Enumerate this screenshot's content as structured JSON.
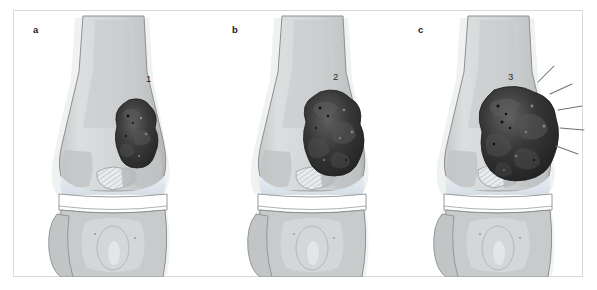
{
  "figure": {
    "type": "medical-illustration",
    "background_color": "#ffffff",
    "frame_color": "#d8d9da"
  },
  "panels": [
    {
      "id": "a",
      "letter": "a",
      "lesion_label": "1",
      "lesion_stage": "small intramedullary lesion",
      "has_burst_lines": false
    },
    {
      "id": "b",
      "letter": "b",
      "lesion_label": "2",
      "lesion_stage": "enlarged lesion expanding toward cortex",
      "has_burst_lines": true
    },
    {
      "id": "c",
      "letter": "c",
      "lesion_label": "3",
      "lesion_stage": "lesion breaking through cortex",
      "has_burst_lines": true
    }
  ],
  "colors": {
    "bone_cortex": "#b9bcbd",
    "bone_medulla": "#cdd0d1",
    "bone_light": "#dadddd",
    "cartilage": "#dfe6ee",
    "joint_space": "#ffffff",
    "soft_tissue": "#d4d6d6",
    "tumor_dark": "#2b2b2b",
    "tumor_mid": "#4a4a4a",
    "tumor_light": "#6b6b6b",
    "outline": "#8d9091",
    "label_text": "#1a1a1a",
    "burst_line": "#6f7273"
  },
  "tumors": [
    {
      "panel": "a",
      "cx": 124,
      "cy": 124,
      "rx": 20,
      "ry": 34
    },
    {
      "panel": "b",
      "cx": 120,
      "cy": 122,
      "rx": 27,
      "ry": 40
    },
    {
      "panel": "c",
      "cx": 120,
      "cy": 124,
      "rx": 35,
      "ry": 44
    }
  ]
}
